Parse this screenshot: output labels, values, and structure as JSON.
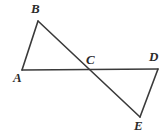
{
  "figure": {
    "background_color": "#ffffff",
    "stroke_color": "#3a3a3a",
    "label_color": "#2b2b2b",
    "stroke_width": 1.6,
    "width": 168,
    "height": 136
  },
  "labels": {
    "a": "A",
    "b": "B",
    "c": "C",
    "d": "D",
    "e": "E"
  },
  "chart_data": {
    "type": "diagram",
    "title": "",
    "points": [
      {
        "name": "A",
        "x": 22,
        "y": 70
      },
      {
        "name": "B",
        "x": 38,
        "y": 21
      },
      {
        "name": "C",
        "x": 92,
        "y": 69
      },
      {
        "name": "D",
        "x": 158,
        "y": 69
      },
      {
        "name": "E",
        "x": 140,
        "y": 117
      }
    ],
    "segments": [
      {
        "name": "AD",
        "from": "A",
        "to": "D"
      },
      {
        "name": "AB",
        "from": "A",
        "to": "B"
      },
      {
        "name": "BE",
        "from": "B",
        "to": "E"
      },
      {
        "name": "DE",
        "from": "D",
        "to": "E"
      }
    ],
    "label_positions": [
      {
        "name": "A",
        "x": 13,
        "y": 71
      },
      {
        "name": "B",
        "x": 31,
        "y": 2
      },
      {
        "name": "C",
        "x": 86,
        "y": 53
      },
      {
        "name": "D",
        "x": 149,
        "y": 50
      },
      {
        "name": "E",
        "x": 134,
        "y": 119
      }
    ]
  }
}
